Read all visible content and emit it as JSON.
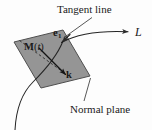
{
  "figure": {
    "labels": {
      "tangent_line": "Tangent line",
      "normal_plane": "Normal plane",
      "line_L": "L",
      "unit_tangent": "e",
      "unit_tangent_subscript": "1",
      "point_M": "M",
      "point_M_open_paren": "(",
      "point_M_param": "t",
      "point_M_close_paren": ")",
      "vector_k": "k"
    },
    "colors": {
      "plane_fill": "#8f8f8f",
      "plane_stroke": "#4a4a4a",
      "curve_stroke": "#2a2a2a",
      "text": "#1a1a1a",
      "background": "#fdfdfd"
    },
    "geometry": {
      "plane_polygon": "14,42 63,30 90,76 41,88",
      "curve_path": "M 16,128 C 18,106 24,92 40,78 C 54,66 62,52 66,40",
      "tangent_path": "M 62,42 C 78,34 104,30 131,32",
      "leader_tangent_label": "M 92,17 L 63,38",
      "leader_normal_label": "M 84,100 L 90,78",
      "k_vector_path": "M 39,48 L 67,76",
      "dashed_path": "M 20,40 L 62,72"
    }
  }
}
